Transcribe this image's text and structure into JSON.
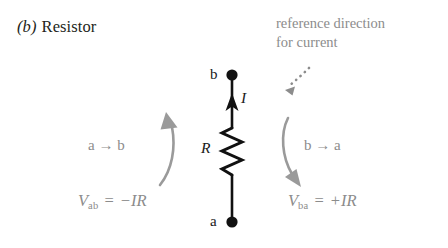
{
  "figure": {
    "label_prefix": "(b)",
    "title": "Resistor",
    "background_color": "#ffffff"
  },
  "annotation": {
    "line1": "reference direction",
    "line2": "for current",
    "color": "#8c8c8c"
  },
  "circuit": {
    "type": "resistor-two-terminal",
    "top_node_label": "b",
    "bottom_node_label": "a",
    "resistance_symbol": "R",
    "current_symbol": "I",
    "current_direction": "upward (a to b)",
    "line_color": "#111111"
  },
  "left_branch": {
    "path_label": "a → b",
    "equation": {
      "variable": "V",
      "subscript": "ab",
      "equals": "=",
      "sign": "−",
      "expression": "IR",
      "full": "Vₐᵇ = −IR"
    },
    "arrow_direction": "up",
    "color": "#9a9a9a"
  },
  "right_branch": {
    "path_label": "b → a",
    "equation": {
      "variable": "V",
      "subscript": "ba",
      "equals": "=",
      "sign": "+",
      "expression": "IR",
      "full": "Vᵇₐ = +IR"
    },
    "arrow_direction": "down",
    "color": "#9a9a9a"
  },
  "icons": {
    "dotted_pointer": "dotted-curved-arrow-icon",
    "current_arrow": "up-arrow-icon",
    "terminal_top": "terminal-dot-icon",
    "terminal_bottom": "terminal-dot-icon",
    "resistor": "zigzag-resistor-icon"
  }
}
